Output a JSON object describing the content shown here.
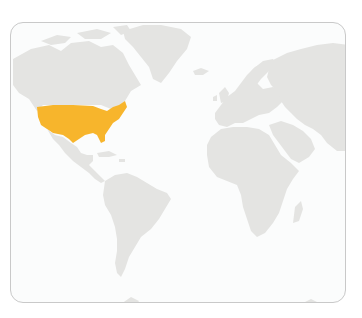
{
  "map": {
    "title": "World map highlighting the United States",
    "projection": "equirectangular-like (cropped: Americas, Europe, Africa, western Asia)",
    "colors": {
      "background": "#ffffff",
      "frame_fill": "#fbfcfc",
      "frame_border": "#c9c9c9",
      "land": "#e4e4e2",
      "highlight": "#f7b52c"
    },
    "regions": [
      {
        "name": "North America",
        "highlighted": false
      },
      {
        "name": "United States",
        "highlighted": true
      },
      {
        "name": "Greenland",
        "highlighted": false
      },
      {
        "name": "Central America",
        "highlighted": false
      },
      {
        "name": "South America",
        "highlighted": false
      },
      {
        "name": "Europe",
        "highlighted": false
      },
      {
        "name": "Africa",
        "highlighted": false
      },
      {
        "name": "Asia",
        "highlighted": false
      },
      {
        "name": "Madagascar",
        "highlighted": false
      },
      {
        "name": "Antarctica",
        "highlighted": false
      }
    ],
    "highlighted_label": "United States"
  }
}
